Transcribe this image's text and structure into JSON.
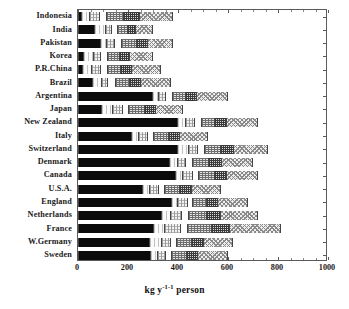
{
  "chart_data": {
    "type": "bar",
    "orientation": "horizontal",
    "stacked": true,
    "title": "",
    "subtitle": "",
    "xlabel": "kg y⁻¹ person⁻¹",
    "ylabel": "",
    "xlim": [
      0,
      1000
    ],
    "ylim": null,
    "grid": false,
    "legend": null,
    "legend_position": "none",
    "xticks": [
      0,
      200,
      400,
      600,
      800,
      1000
    ],
    "xticklabels": [
      "0",
      "200",
      "400",
      "600",
      "800",
      "1000"
    ],
    "categories": [
      "Indonesia",
      "India",
      "Pakistan",
      "Korea",
      "P.R.China",
      "Brazil",
      "Argentina",
      "Japan",
      "New  Zealand",
      "Italy",
      "Switzerland",
      "Denmark",
      "Canada",
      "U.S.A.",
      "England",
      "Netherlands",
      "France",
      "W.Germany",
      "Sweden"
    ],
    "segment_styles": [
      "black",
      "vlight",
      "light",
      "white",
      "mid",
      "dark",
      "check"
    ],
    "series": [
      {
        "name": "segment-1",
        "style": "black",
        "values": [
          14,
          66,
          92,
          22,
          20,
          60,
          300,
          96,
          400,
          216,
          400,
          366,
          392,
          260,
          376,
          336,
          304,
          288,
          292
        ]
      },
      {
        "name": "segment-2",
        "style": "vlight",
        "values": [
          34,
          44,
          24,
          42,
          36,
          34,
          22,
          44,
          32,
          26,
          44,
          34,
          26,
          28,
          24,
          36,
          44,
          46,
          28
        ]
      },
      {
        "name": "segment-3",
        "style": "light",
        "values": [
          38,
          26,
          30,
          28,
          34,
          26,
          30,
          38,
          36,
          36,
          36,
          32,
          40,
          34,
          40,
          44,
          62,
          36,
          30
        ]
      },
      {
        "name": "segment-4",
        "style": "white",
        "values": [
          30,
          22,
          28,
          26,
          30,
          30,
          26,
          26,
          26,
          24,
          28,
          26,
          26,
          24,
          20,
          26,
          30,
          24,
          26
        ]
      },
      {
        "name": "segment-5",
        "style": "mid",
        "values": [
          68,
          40,
          62,
          48,
          52,
          56,
          52,
          62,
          54,
          60,
          64,
          66,
          62,
          62,
          56,
          72,
          94,
          62,
          60
        ]
      },
      {
        "name": "segment-6",
        "style": "dark",
        "values": [
          64,
          34,
          44,
          40,
          44,
          44,
          46,
          44,
          48,
          44,
          52,
          50,
          48,
          46,
          44,
          56,
          72,
          46,
          44
        ]
      },
      {
        "name": "segment-7",
        "style": "check",
        "values": [
          132,
          68,
          100,
          94,
          114,
          120,
          124,
          110,
          124,
          114,
          136,
          126,
          126,
          116,
          120,
          150,
          204,
          118,
          120
        ]
      }
    ],
    "totals": [
      380,
      300,
      380,
      300,
      330,
      370,
      600,
      420,
      720,
      520,
      760,
      700,
      720,
      570,
      680,
      720,
      810,
      620,
      600
    ]
  }
}
